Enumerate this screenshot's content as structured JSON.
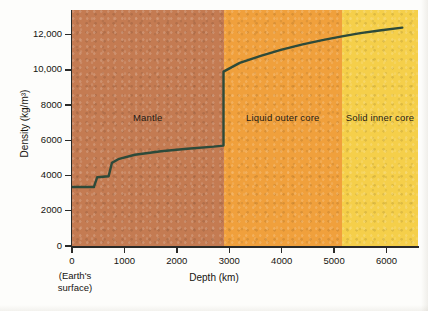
{
  "chart_data": {
    "type": "line",
    "title": "",
    "xlabel": "Depth (km)",
    "ylabel": "Density (kg/m³)",
    "xlim": [
      0,
      6600
    ],
    "ylim": [
      0,
      13400
    ],
    "grid": false,
    "legend_position": "none",
    "x_ticks": [
      0,
      1000,
      2000,
      3000,
      4000,
      5000,
      6000
    ],
    "x_tick_labels": [
      "0",
      "1000",
      "2000",
      "3000",
      "4000",
      "5000",
      "6000"
    ],
    "y_ticks": [
      0,
      2000,
      4000,
      6000,
      8000,
      10000,
      12000
    ],
    "y_tick_labels": [
      "0",
      "2000",
      "4000",
      "6000",
      "8000",
      "10,000",
      "12,000"
    ],
    "origin_note": [
      "(Earth's",
      "surface)"
    ],
    "series": [
      {
        "name": "Earth density profile",
        "color": "#2d4a3a",
        "x": [
          0,
          420,
          420,
          480,
          480,
          700,
          700,
          760,
          760,
          900,
          1200,
          1700,
          2200,
          2700,
          2890,
          2890,
          3200,
          3600,
          4000,
          4400,
          4800,
          5150,
          5500,
          5900,
          6300
        ],
        "y": [
          3350,
          3350,
          3370,
          3900,
          3900,
          3960,
          3980,
          4700,
          4720,
          4950,
          5180,
          5380,
          5520,
          5640,
          5700,
          9900,
          10400,
          10800,
          11150,
          11450,
          11700,
          11900,
          12090,
          12250,
          12400
        ]
      }
    ],
    "regions": [
      {
        "name": "mantle",
        "label": "Mantle",
        "x_start": 0,
        "x_end": 2890,
        "color": "#c47b52"
      },
      {
        "name": "outer-core",
        "label": "Liquid outer core",
        "x_start": 2890,
        "x_end": 5150,
        "color": "#f0a03c"
      },
      {
        "name": "inner-core",
        "label": "Solid inner core",
        "x_start": 5150,
        "x_end": 6600,
        "color": "#f5cf4a"
      }
    ]
  }
}
